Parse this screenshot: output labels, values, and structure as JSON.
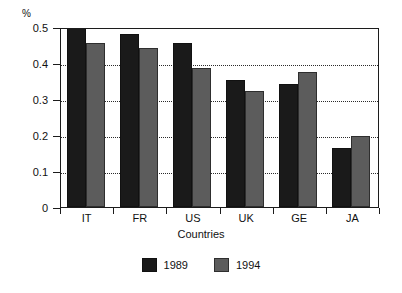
{
  "chart_data": {
    "type": "bar",
    "title": "",
    "subtitle": "",
    "xlabel": "Countries",
    "ylabel": "%",
    "unit_label": "%",
    "categories": [
      "IT",
      "FR",
      "US",
      "UK",
      "GE",
      "JA"
    ],
    "series": [
      {
        "name": "1989",
        "color": "#1a1a1a",
        "values": [
          0.5,
          0.48,
          0.455,
          0.353,
          0.342,
          0.165
        ]
      },
      {
        "name": "1994",
        "color": "#5c5c5c",
        "values": [
          0.455,
          0.442,
          0.385,
          0.322,
          0.376,
          0.196
        ]
      }
    ],
    "ylim": [
      0,
      0.5
    ],
    "yticks": [
      0,
      0.1,
      0.2,
      0.3,
      0.4,
      0.5
    ],
    "ytick_labels": [
      "0",
      "0.1",
      "0.2",
      "0.3",
      "0.4",
      "0.5"
    ],
    "grid": true,
    "grid_axis": "y",
    "grid_style": "dotted",
    "legend_position": "bottom",
    "legend_entries": [
      "1989",
      "1994"
    ]
  }
}
